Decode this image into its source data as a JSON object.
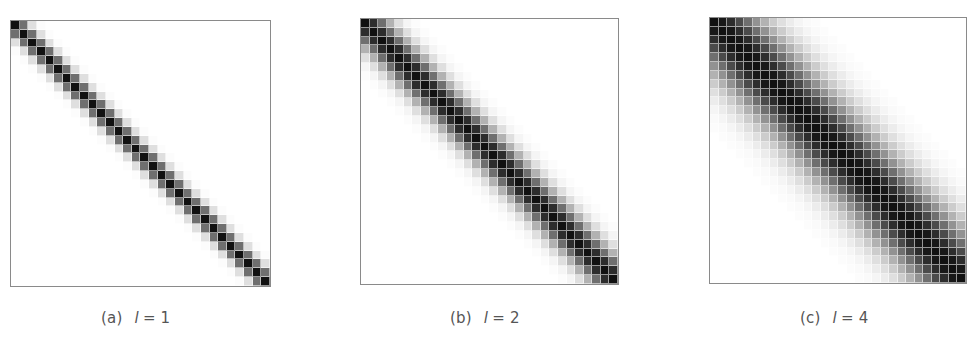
{
  "chart_data": [
    {
      "type": "heatmap",
      "title": "",
      "caption_label": "(a)",
      "caption_var": "l",
      "caption_eq": "= 1",
      "grid_size": 30,
      "lengthscale": 1,
      "kernel": "squared-exponential: k(i,j) = exp(-(i-j)^2 / (2 l^2))",
      "colormap": "white-to-black (greys)",
      "value_range": [
        0,
        1
      ],
      "xlabel": "",
      "ylabel": ""
    },
    {
      "type": "heatmap",
      "title": "",
      "caption_label": "(b)",
      "caption_var": "l",
      "caption_eq": "= 2",
      "grid_size": 30,
      "lengthscale": 2,
      "kernel": "squared-exponential: k(i,j) = exp(-(i-j)^2 / (2 l^2))",
      "colormap": "white-to-black (greys)",
      "value_range": [
        0,
        1
      ],
      "xlabel": "",
      "ylabel": ""
    },
    {
      "type": "heatmap",
      "title": "",
      "caption_label": "(c)",
      "caption_var": "l",
      "caption_eq": "= 4",
      "grid_size": 30,
      "lengthscale": 4,
      "kernel": "squared-exponential: k(i,j) = exp(-(i-j)^2 / (2 l^2))",
      "colormap": "white-to-black (greys)",
      "value_range": [
        0,
        1
      ],
      "xlabel": "",
      "ylabel": ""
    }
  ],
  "colors": {
    "frame": "#8a8a8a",
    "caption": "#555555",
    "max": "#111111",
    "min": "#ffffff"
  }
}
